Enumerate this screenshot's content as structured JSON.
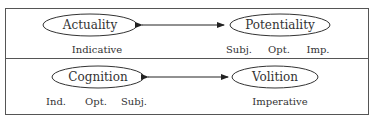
{
  "top_row": {
    "left_node": "Actuality",
    "right_node": "Potentiality",
    "left_labels": [
      "Indicative"
    ],
    "right_labels": [
      "Subj.",
      "Opt.",
      "Imp."
    ]
  },
  "bottom_row": {
    "left_node": "Cognition",
    "right_node": "Volition",
    "left_labels": [
      "Ind.",
      "Opt.",
      "Subj."
    ],
    "right_labels": [
      "Imperative"
    ]
  }
}
